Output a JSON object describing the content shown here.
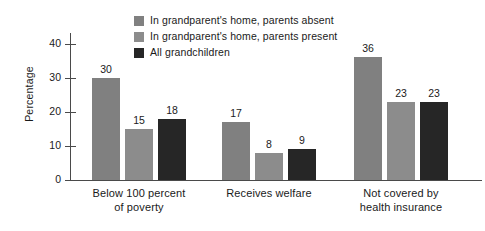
{
  "chart_data": {
    "type": "bar",
    "title": "",
    "subtitle": "",
    "xlabel": "",
    "ylabel": "Percentage",
    "ylim": [
      0,
      44
    ],
    "yticks": [
      0,
      10,
      20,
      30,
      40
    ],
    "ytick_labels": [
      "0",
      "10",
      "20",
      "30",
      "40"
    ],
    "grid": false,
    "legend_position": "top-center",
    "categories": [
      "Below 100 percent of poverty",
      "Receives welfare",
      "Not covered by health insurance"
    ],
    "category_lines": [
      [
        "Below 100 percent",
        "of poverty"
      ],
      [
        "Receives welfare",
        ""
      ],
      [
        "Not covered by",
        "health insurance"
      ]
    ],
    "series": [
      {
        "name": "In grandparent's home, parents absent",
        "color": "#808080",
        "values": [
          30,
          17,
          36
        ]
      },
      {
        "name": "In grandparent's home, parents present",
        "color": "#8c8c8c",
        "values": [
          15,
          8,
          23
        ]
      },
      {
        "name": "All grandchildren",
        "color": "#262626",
        "values": [
          18,
          9,
          23
        ]
      }
    ]
  },
  "axis": {
    "y_title": "Percentage"
  },
  "colors": {
    "axis": "#4a4a4a",
    "text": "#1a1a1a",
    "background": "#ffffff"
  }
}
